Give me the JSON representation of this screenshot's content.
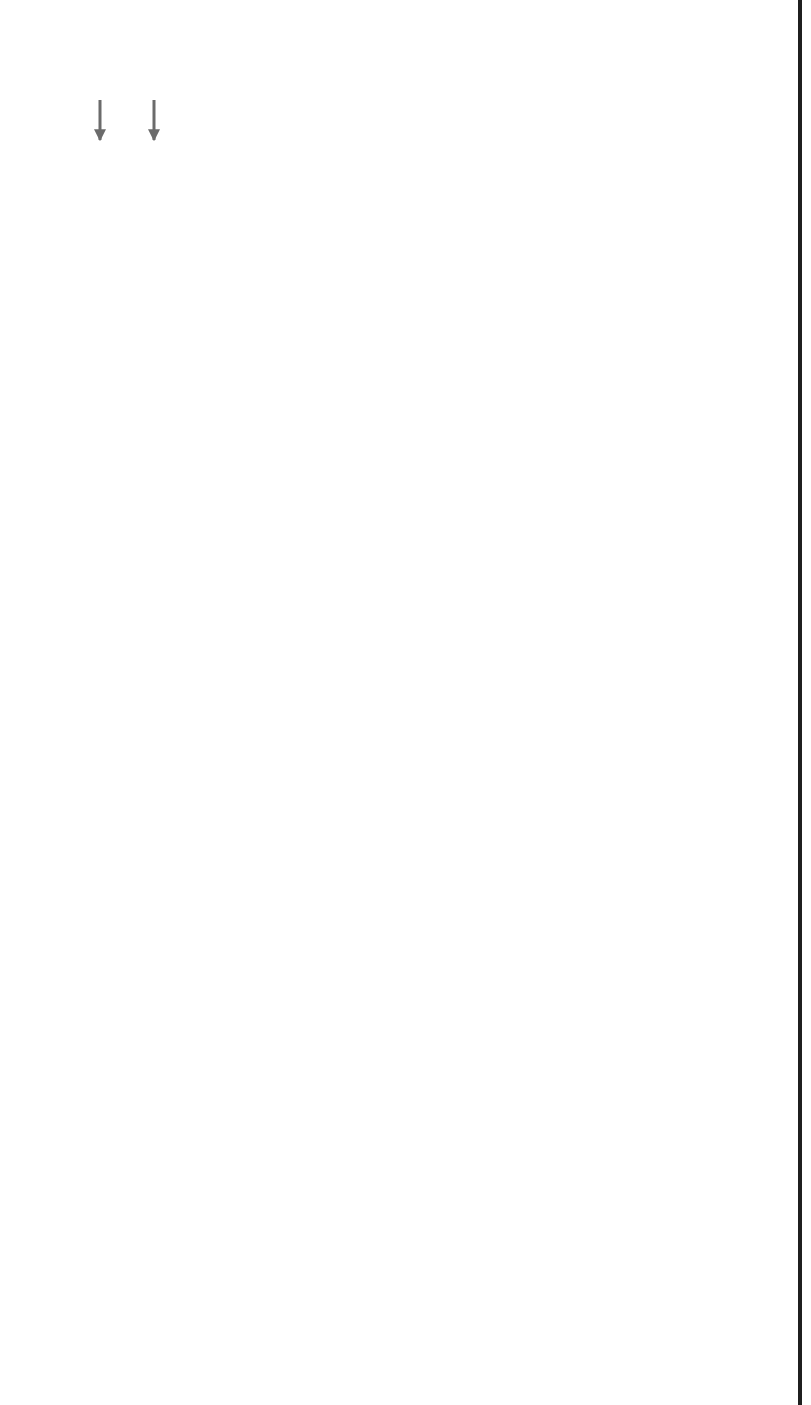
{
  "diagram": {
    "orientation": "rotated 90° counter-clockwise",
    "colors": {
      "process_box": "#4d4d4d",
      "flow_line": "#6b6b6b",
      "external_outline": "#5a5a5a"
    },
    "boxes": {
      "storage": {
        "label": "Storage",
        "caption": "L Basin"
      },
      "purex": {
        "line1": "PUREX",
        "line2": "Separation",
        "caption": "H-Area"
      },
      "tank_farm": {
        "label": "Tank Farm",
        "sub_llw": "LLW",
        "sub_sludge": "Sludge",
        "sub_hlw": "HLW",
        "caption1": "F & H Area",
        "caption2": "Tank Farm"
      },
      "vitrification": {
        "label": "Vitrification",
        "caption1": "Defense Waste",
        "caption2": "Processing Facility"
      },
      "onsite_storage": {
        "line1": "On-Site",
        "line2": "Storage",
        "caption1": "Glass Waste",
        "caption2": "Storage Building"
      },
      "csr_removal": {
        "line1": "Cs, Sr,",
        "line2": "Actinides",
        "line3": "Removal",
        "caption1": "Salt Waste",
        "caption2": "Processing"
      },
      "saltstone": {
        "line1": "Saltstone",
        "line2": "Process",
        "caption1": "Salt Processing",
        "caption2": "Facility"
      },
      "onsite_disposal": {
        "line1": "On-Site",
        "line2": "Disposal",
        "caption1": "Salt Disposal",
        "caption2": "Facility"
      },
      "pu_preparation": {
        "line1": "Pu",
        "line2": "P-eparation"
      },
      "pu_storage": {
        "line1": "Plutenium",
        "line2": "Sto-age",
        "caption": "K-Area"
      },
      "pit_conversion": {
        "line1": "Pit",
        "line2": "Cenversion"
      },
      "mox_fab": {
        "line1": "Mixed Oxide",
        "line2": "Fuel",
        "line3": "Fabrication"
      }
    },
    "external": {
      "offsite_eu": {
        "line1": "Offsite",
        "line2": "EU"
      },
      "offsite_heu_pu": {
        "line1": "Offsite",
        "line2": "HEU/Pu"
      },
      "power_reactors": {
        "line1": "Power",
        "line2": "Reactors"
      },
      "mox_fuel": {
        "line1": "MOX",
        "line2": "Fuel"
      },
      "storage": {
        "label": "Storage"
      },
      "repository": {
        "label": "Repository"
      }
    },
    "flows": {
      "al_clad_unf_1": "Al-Clad",
      "al_clad_unf_2": "UNF",
      "heu": "HEU",
      "non_moxable_1": "Non-Moxable Pu",
      "non_moxable_2": "Non-Moxable Pu",
      "leu": "LEU",
      "pu": "Pu",
      "llw": "LLW",
      "unf_hlw_1": "UNF",
      "unf_hlw_2": "HLW",
      "sludge": "Sludge",
      "canisters": "Canisters",
      "csr_actinides_1": "Cs, Sr,",
      "csr_actinides_2": "Actinides",
      "contaminated_salt_1": "Contaminated",
      "contaminated_salt_2": "Salt",
      "hlw": "HLW",
      "decon_1": "Decon-",
      "decon_2": "taminated",
      "decon_3": "Salt",
      "llw_from_tf_1": "LLW from",
      "llw_from_tf_2": "Tank Farm",
      "grout": "Grout",
      "poc_long": "Pipe Overpack Containers (POC)",
      "poc": "POC",
      "mixed_oxide_fuel": "Mixed Oxide Fuel",
      "pu_oxides_1": "Pu Oxides",
      "pu_oxides_2": "Pu Oxides",
      "recovered_heu": "Recovered HEU",
      "unirradiated_fuel": "Unirradiated Fuel"
    },
    "acronyms": {
      "title": "Acronyms",
      "items": [
        {
          "abbr": "Al",
          "meaning": "Aluminum"
        },
        {
          "abbr": "HEU",
          "meaning": "Highly Enriched Uranium"
        },
        {
          "abbr": "HLW",
          "meaning": "High Level Waste"
        },
        {
          "abbr": "LEU",
          "meaning": "Low Enriched Uranium"
        },
        {
          "abbr": "LLW",
          "meaning": "Low Level Waste"
        },
        {
          "abbr": "MOX",
          "meaning": "Mixed Oxide"
        },
        {
          "abbr": "Pu",
          "meaning": "Plutonium"
        },
        {
          "abbr": "UNF",
          "meaning": "Used Nuclear Fuel"
        }
      ]
    }
  }
}
